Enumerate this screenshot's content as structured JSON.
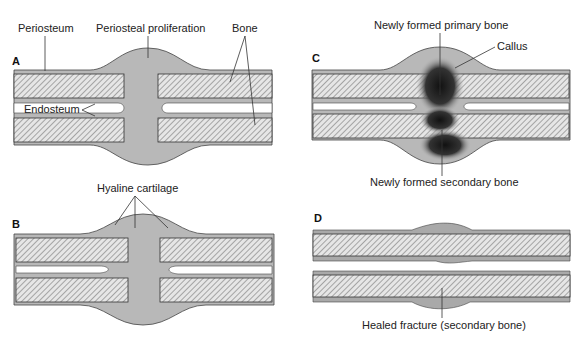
{
  "figure": {
    "colors": {
      "background": "#ffffff",
      "tissue": "#b8b8b8",
      "periosteum": "#a9a9a9",
      "callus_dark": "#1a1a1a",
      "line": "#333333"
    },
    "panels": [
      {
        "letter": "A",
        "labels": {
          "periosteum": "Periosteum",
          "periosteal_proliferation": "Periosteal proliferation",
          "bone": "Bone",
          "endosteum": "Endosteum"
        }
      },
      {
        "letter": "B",
        "labels": {
          "hyaline_cartilage": "Hyaline cartilage"
        }
      },
      {
        "letter": "C",
        "labels": {
          "primary_bone": "Newly formed primary bone",
          "callus": "Callus",
          "secondary_bone": "Newly formed secondary bone"
        }
      },
      {
        "letter": "D",
        "labels": {
          "healed_fracture": "Healed fracture (secondary bone)"
        }
      }
    ]
  }
}
